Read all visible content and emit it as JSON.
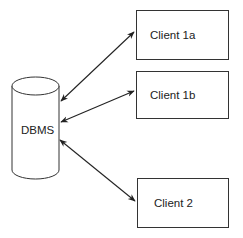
{
  "diagram": {
    "database": {
      "label": "DBMS",
      "shape": "cylinder"
    },
    "clients": [
      {
        "label": "Client 1a"
      },
      {
        "label": "Client 1b"
      },
      {
        "label": "Client 2"
      }
    ],
    "connections": [
      {
        "from": "DBMS",
        "to": "Client 1a",
        "type": "bidirectional-arrow"
      },
      {
        "from": "DBMS",
        "to": "Client 1b",
        "type": "bidirectional-arrow"
      },
      {
        "from": "DBMS",
        "to": "Client 2",
        "type": "bidirectional-arrow"
      }
    ],
    "colors": {
      "stroke": "#333333",
      "background": "#ffffff"
    }
  }
}
